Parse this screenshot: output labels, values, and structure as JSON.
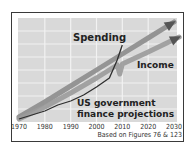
{
  "chart_data": {
    "type": "line",
    "title": "US government finance projections",
    "source_note": "Based on Figures 76 & 123",
    "xlabel": "",
    "ylabel": "",
    "xlim": [
      1970,
      2030
    ],
    "ylim": [
      0,
      100
    ],
    "x_ticks": [
      "1970",
      "1980",
      "1990",
      "2000",
      "2010",
      "2020",
      "2030"
    ],
    "grid": true,
    "y_units": "relative index (no y-axis labels shown)",
    "series": [
      {
        "name": "Spending",
        "style": "projection-arrow",
        "color": "#8c8c8c",
        "x": [
          1970,
          1980,
          1990,
          2000,
          2010,
          2020,
          2030
        ],
        "y": [
          3,
          18,
          34,
          50,
          66,
          82,
          98
        ]
      },
      {
        "name": "Income",
        "style": "projection-arrow",
        "color": "#9a9a9a",
        "x": [
          1970,
          1980,
          1990,
          2000,
          2008,
          2009,
          2010,
          2020,
          2032
        ],
        "y": [
          1,
          13,
          27,
          42,
          55,
          46,
          56,
          68,
          83
        ]
      },
      {
        "name": "Actual",
        "style": "thin-line",
        "color": "#2e2e2e",
        "x": [
          1970,
          1975,
          1980,
          1985,
          1990,
          1995,
          2000,
          2005,
          2008,
          2010
        ],
        "y": [
          1,
          5,
          9,
          15,
          19,
          25,
          33,
          42,
          60,
          75
        ]
      }
    ],
    "annotations": [
      {
        "text": "Spending",
        "near": "upper-middle"
      },
      {
        "text": "Income",
        "near": "right-middle"
      },
      {
        "text": "US government",
        "near": "bottom-middle"
      },
      {
        "text": "finance projections",
        "near": "bottom-middle"
      }
    ],
    "colors": {
      "plot_bg": "#d9d9d9",
      "grid": "#f2f2f2",
      "frame": "#3a3a3a"
    }
  }
}
